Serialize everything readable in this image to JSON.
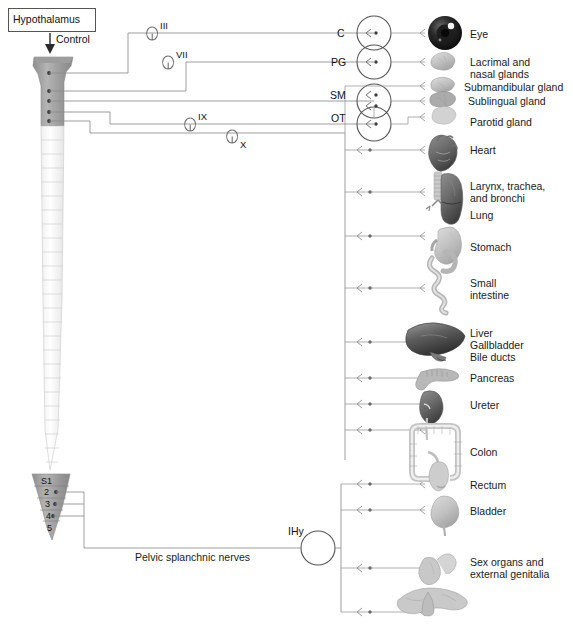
{
  "control_box": {
    "label": "Hypothalamus",
    "arrow_label": "Control"
  },
  "cranial_nerves": [
    {
      "id": "III",
      "label": "III"
    },
    {
      "id": "VII",
      "label": "VII"
    },
    {
      "id": "IX",
      "label": "IX"
    },
    {
      "id": "X",
      "label": "X"
    }
  ],
  "ganglia": [
    {
      "id": "C",
      "label": "C"
    },
    {
      "id": "PG",
      "label": "PG"
    },
    {
      "id": "SM",
      "label": "SM"
    },
    {
      "id": "OT",
      "label": "OT"
    },
    {
      "id": "IHy",
      "label": "IHy"
    }
  ],
  "spinal_segments": [
    {
      "label": "S1"
    },
    {
      "label": "2"
    },
    {
      "label": "3"
    },
    {
      "label": "4"
    },
    {
      "label": "5"
    }
  ],
  "pelvic_nerve": {
    "label": "Pelvic splanchnic nerves"
  },
  "targets": [
    {
      "label": "Eye",
      "icon": "eye-icon"
    },
    {
      "label": "Lacrimal and\nnasal glands",
      "icon": "lacrimal-gland-icon"
    },
    {
      "label": "Submandibular gland",
      "icon": "submandibular-gland-icon"
    },
    {
      "label": "Sublingual gland",
      "icon": "sublingual-gland-icon"
    },
    {
      "label": "Parotid gland",
      "icon": "parotid-gland-icon"
    },
    {
      "label": "Heart",
      "icon": "heart-icon"
    },
    {
      "label": "Larynx, trachea,\nand bronchi",
      "icon": "airway-icon"
    },
    {
      "label": "Lung",
      "icon": "lung-icon"
    },
    {
      "label": "Stomach",
      "icon": "stomach-icon"
    },
    {
      "label": "Small\nintestine",
      "icon": "small-intestine-icon"
    },
    {
      "label": "Liver\nGallbladder\nBile ducts",
      "icon": "liver-icon"
    },
    {
      "label": "Pancreas",
      "icon": "pancreas-icon"
    },
    {
      "label": "Ureter",
      "icon": "ureter-icon"
    },
    {
      "label": "Colon",
      "icon": "colon-icon"
    },
    {
      "label": "Rectum",
      "icon": "rectum-icon"
    },
    {
      "label": "Bladder",
      "icon": "bladder-icon"
    },
    {
      "label": "Sex organs and\nexternal genitalia",
      "icon": "sex-organs-icon"
    }
  ],
  "colors": {
    "line": "#8c8c8c",
    "text": "#1a1a1a",
    "cord_gray": "#9e9e9e",
    "cord_light": "#fdfdfd",
    "organ_gray": "#b9b9b9",
    "organ_dark": "#5b5b5b"
  }
}
